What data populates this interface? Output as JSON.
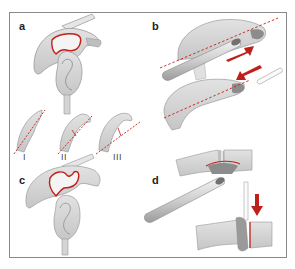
{
  "figure": {
    "panels": [
      {
        "id": "a",
        "label": "a",
        "description": "Scapula lateral view with outlined glenoid/acromion region (red outline)"
      },
      {
        "id": "b",
        "label": "b",
        "description": "Acromion undersurface resection with burr; red arrows show direction; dashed red resection line"
      },
      {
        "id": "c",
        "label": "c",
        "description": "Scapula view with irregular red outline after resection"
      },
      {
        "id": "d",
        "label": "d",
        "description": "Clavicle/acromion joint resection with burr; red arrow downward; red resection edge"
      }
    ],
    "subtypes": {
      "labels": [
        "I",
        "II",
        "III"
      ],
      "description": "Acromion morphology types with dashed red lines"
    },
    "colors": {
      "bone_fill": "#d4d4d4",
      "bone_stroke": "#9a9a9a",
      "dark_shade": "#8c8c8c",
      "accent_red": "#c0201a",
      "frame": "#8a8a8a"
    }
  }
}
